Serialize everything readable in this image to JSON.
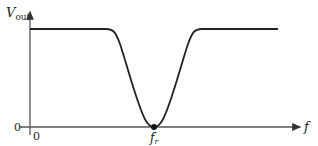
{
  "diagram": {
    "type": "notch-filter-response",
    "y_axis_label": "V",
    "y_axis_label_sub": "out",
    "x_axis_label": "f",
    "origin_y_label": "0",
    "origin_x_label": "0",
    "notch_label": "f",
    "notch_label_sub": "r",
    "colors": {
      "line": "#222222",
      "axis": "#555555",
      "background": "#ffffff"
    }
  }
}
